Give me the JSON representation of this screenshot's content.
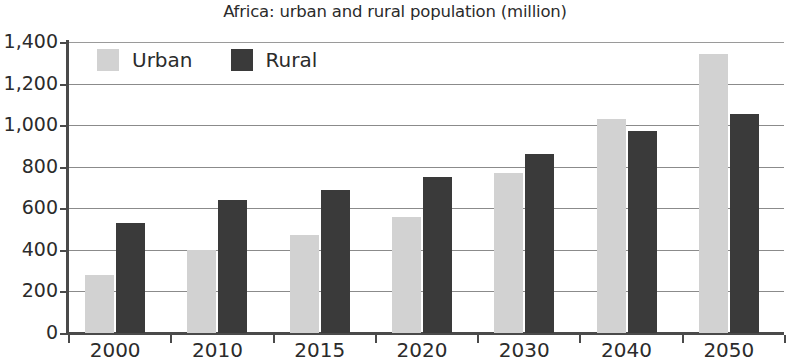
{
  "chart_data": {
    "type": "bar",
    "title": "Africa: urban and rural population (million)",
    "xlabel": "",
    "ylabel": "",
    "categories": [
      "2000",
      "2010",
      "2015",
      "2020",
      "2030",
      "2040",
      "2050"
    ],
    "series": [
      {
        "name": "Urban",
        "color": "#d2d2d2",
        "values": [
          280,
          400,
          470,
          560,
          770,
          1030,
          1340
        ]
      },
      {
        "name": "Rural",
        "color": "#3a3a3a",
        "values": [
          530,
          640,
          690,
          750,
          860,
          970,
          1055
        ]
      }
    ],
    "ylim": [
      0,
      1400
    ],
    "ytick_step": 200,
    "ytick_labels": [
      "0",
      "200",
      "400",
      "600",
      "800",
      "1,000",
      "1,200",
      "1,400"
    ],
    "ytick_values": [
      0,
      200,
      400,
      600,
      800,
      1000,
      1200,
      1400
    ],
    "grid": "horizontal",
    "legend_position": "top-left-inside"
  }
}
